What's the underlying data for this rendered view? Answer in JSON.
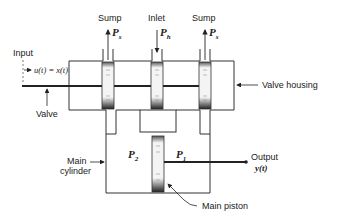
{
  "diagram": {
    "labels": {
      "input": "Input",
      "input_signal": "u(t) = x(t)",
      "valve": "Valve",
      "valve_housing": "Valve housing",
      "sump_left": "Sump",
      "sump_left_pressure": "P",
      "sump_left_pressure_sub": "s",
      "inlet": "Inlet",
      "inlet_pressure": "P",
      "inlet_pressure_sub": "h",
      "sump_right": "Sump",
      "sump_right_pressure": "P",
      "sump_right_pressure_sub": "s",
      "main_cylinder_line1": "Main",
      "main_cylinder_line2": "cylinder",
      "chamber_left_pressure": "P",
      "chamber_left_pressure_sub": "2",
      "chamber_right_pressure": "P",
      "chamber_right_pressure_sub": "1",
      "output": "Output",
      "output_signal": "y(t)",
      "main_piston": "Main piston"
    },
    "colors": {
      "stroke": "#333333",
      "text": "#222222",
      "background": "#ffffff"
    }
  }
}
